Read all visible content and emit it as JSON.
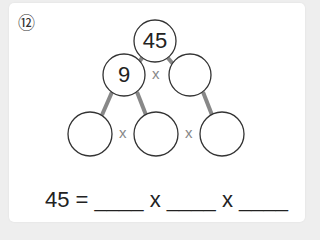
{
  "problem": {
    "number": "⑫",
    "tree": {
      "root": "45",
      "middle_left": "9",
      "middle_right": "",
      "bottom": [
        "",
        "",
        ""
      ]
    },
    "operator": "x",
    "equation": {
      "lhs": "45",
      "equals": "=",
      "blank": "____",
      "operator": "x"
    }
  },
  "colors": {
    "background": "#eeeeee",
    "card": "#ffffff",
    "circle_stroke": "#333333",
    "connector": "#888888",
    "operator": "#888888"
  }
}
